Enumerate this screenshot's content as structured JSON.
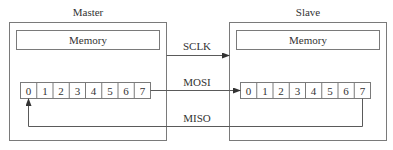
{
  "master": {
    "title": "Master",
    "memory_label": "Memory",
    "register_bits": [
      "0",
      "1",
      "2",
      "3",
      "4",
      "5",
      "6",
      "7"
    ]
  },
  "slave": {
    "title": "Slave",
    "memory_label": "Memory",
    "register_bits": [
      "0",
      "1",
      "2",
      "3",
      "4",
      "5",
      "6",
      "7"
    ]
  },
  "signals": {
    "sclk": "SCLK",
    "mosi": "MOSI",
    "miso": "MISO"
  }
}
